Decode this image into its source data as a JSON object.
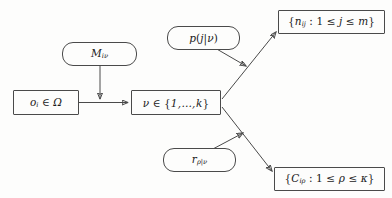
{
  "diagram": {
    "background_color": "#fdfdfc",
    "line_color": "#4a4a4a",
    "text_color": "#1a1a1a",
    "nodes": {
      "observation": {
        "shape": "rectangle",
        "text": "oᵢ ∈ Ω",
        "symbol": "o",
        "subscript": "i",
        "relation": "∈",
        "set": "Ω"
      },
      "mixture": {
        "shape": "rounded",
        "text": "Mᵢᵛ",
        "symbol": "M",
        "subscript": "iν"
      },
      "state": {
        "shape": "rectangle",
        "text": "ν ∈ {1,…,k}",
        "symbol": "ν",
        "relation": "∈",
        "set": "{1, … , k}"
      },
      "emission": {
        "shape": "rounded",
        "text": "p(j|ν)",
        "symbol": "p"
      },
      "rate": {
        "shape": "rounded",
        "text": "rρ|ν",
        "symbol": "r",
        "subscript": "ρ|ν"
      },
      "counts": {
        "shape": "rectangle",
        "text": "{nᵢⱼ : 1 ≤ j ≤ m}",
        "symbol": "n",
        "subscript": "ij",
        "condition": "1 ≤ j ≤ m"
      },
      "costs": {
        "shape": "rectangle",
        "text": "{Cᵢρ : 1 ≤ ρ ≤ κ}",
        "symbol": "C",
        "subscript": "iρ",
        "condition": "1 ≤ ρ ≤ κ"
      }
    },
    "edges": [
      {
        "name": "observation-to-state",
        "from": "observation",
        "to": "state",
        "style": "solid-arrow"
      },
      {
        "name": "mixture-to-observation-state-link",
        "from": "mixture",
        "to": "observation-state-link",
        "style": "solid-arrow"
      },
      {
        "name": "state-to-counts",
        "from": "state",
        "to": "counts",
        "style": "solid-arrow"
      },
      {
        "name": "state-to-costs",
        "from": "state",
        "to": "costs",
        "style": "solid-arrow"
      },
      {
        "name": "emission-to-counts-edge",
        "from": "emission",
        "to": "state-to-counts",
        "style": "solid-arrow"
      },
      {
        "name": "rate-to-costs-edge",
        "from": "rate",
        "to": "state-to-costs",
        "style": "solid-arrow"
      }
    ]
  }
}
